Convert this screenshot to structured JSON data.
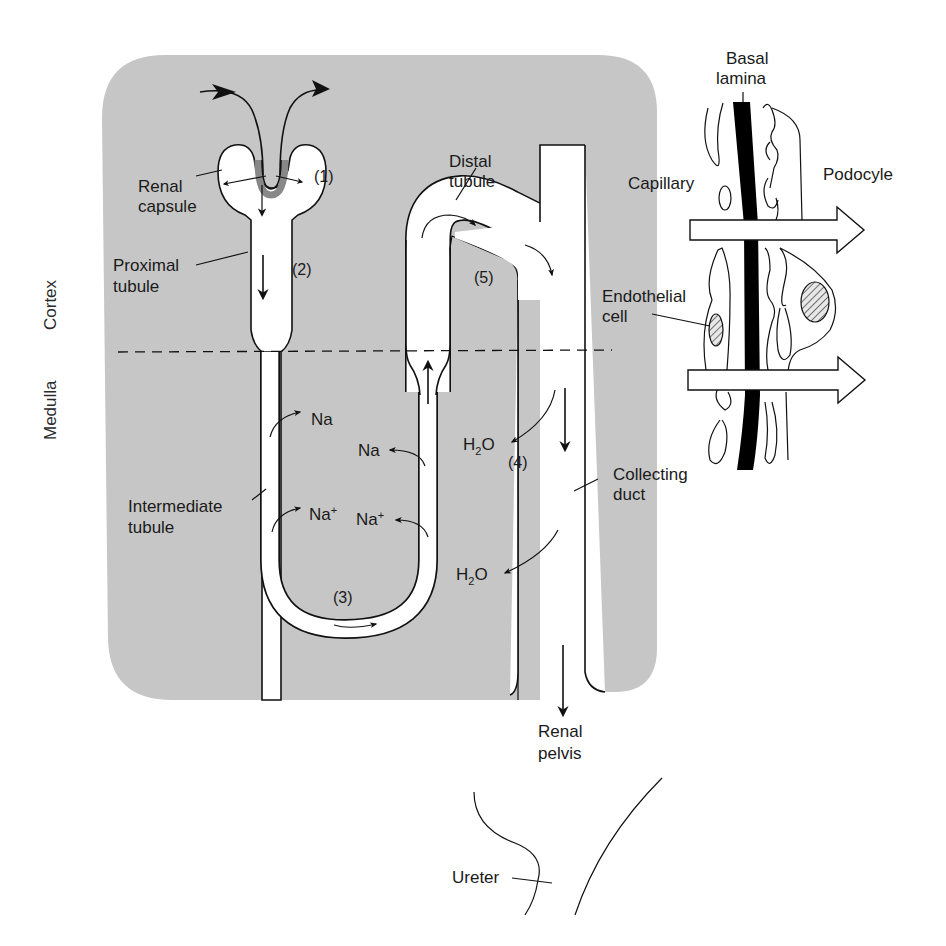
{
  "diagram": {
    "type": "nephron-anatomy",
    "colors": {
      "tissue_background": "#c6c6c6",
      "tube_fill": "#ffffff",
      "ink": "#111111",
      "basal_lamina": "#000000"
    },
    "regions": {
      "cortex": "Cortex",
      "medulla": "Medulla"
    },
    "labels": {
      "renal_capsule_l1": "Renal",
      "renal_capsule_l2": "capsule",
      "proximal_tubule_l1": "Proximal",
      "proximal_tubule_l2": "tubule",
      "distal_tubule_l1": "Distal",
      "distal_tubule_l2": "tubule",
      "intermediate_tubule_l1": "Intermediate",
      "intermediate_tubule_l2": "tubule",
      "collecting_duct_l1": "Collecting",
      "collecting_duct_l2": "duct",
      "renal_pelvis_l1": "Renal",
      "renal_pelvis_l2": "pelvis",
      "ureter": "Ureter",
      "basal_lamina_l1": "Basal",
      "basal_lamina_l2": "lamina",
      "capillary": "Capillary",
      "podocyte": "Podocyle",
      "endothelial_cell_l1": "Endothelial",
      "endothelial_cell_l2": "cell"
    },
    "step_markers": {
      "s1": "(1)",
      "s2": "(2)",
      "s3": "(3)",
      "s4": "(4)",
      "s5": "(5)"
    },
    "ions": {
      "na_desc_upper": "Na",
      "na_asc_upper": "Na",
      "na_desc_lower_base": "Na",
      "na_desc_lower_sup": "+",
      "na_asc_lower_base": "Na",
      "na_asc_lower_sup": "+",
      "h2o_upper_h": "H",
      "h2o_upper_sub": "2",
      "h2o_upper_o": "O",
      "h2o_lower_h": "H",
      "h2o_lower_sub": "2",
      "h2o_lower_o": "O"
    }
  }
}
